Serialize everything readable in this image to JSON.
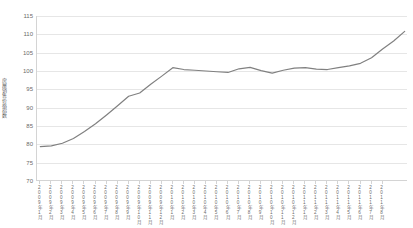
{
  "chart_data": {
    "type": "line",
    "title": "",
    "xlabel": "",
    "ylabel": "房屋销售价格指数",
    "ylim": [
      70,
      115
    ],
    "yticks": [
      70,
      75,
      80,
      85,
      90,
      95,
      100,
      105,
      110,
      115
    ],
    "grid": true,
    "legend": "none",
    "line_color": "#808080",
    "categories": [
      "2009年1月",
      "2009年2月",
      "2009年3月",
      "2009年4月",
      "2009年5月",
      "2009年6月",
      "2009年7月",
      "2009年8月",
      "2009年9月",
      "2009年10月",
      "2009年11月",
      "2009年12月",
      "2010年1月",
      "2010年2月",
      "2010年3月",
      "2010年4月",
      "2010年5月",
      "2010年6月",
      "2010年7月",
      "2010年8月",
      "2010年9月",
      "2010年10月",
      "2010年11月",
      "2010年12月",
      "2011年1月",
      "2011年2月",
      "2011年3月",
      "2011年4月",
      "2011年5月",
      "2011年6月",
      "2011年7月",
      "2011年8月"
    ],
    "values": [
      79.4,
      79.6,
      80.3,
      81.6,
      83.5,
      85.6,
      88.0,
      90.5,
      93.1,
      94.0,
      96.4,
      98.6,
      100.9,
      100.4,
      100.2,
      100.0,
      99.8,
      99.6,
      100.6,
      101.0,
      100.1,
      99.4,
      100.2,
      100.8,
      100.9,
      100.5,
      100.4,
      100.9,
      101.4,
      102.1,
      103.6,
      106.0
    ],
    "values_tail": [
      108.2,
      110.8
    ]
  }
}
